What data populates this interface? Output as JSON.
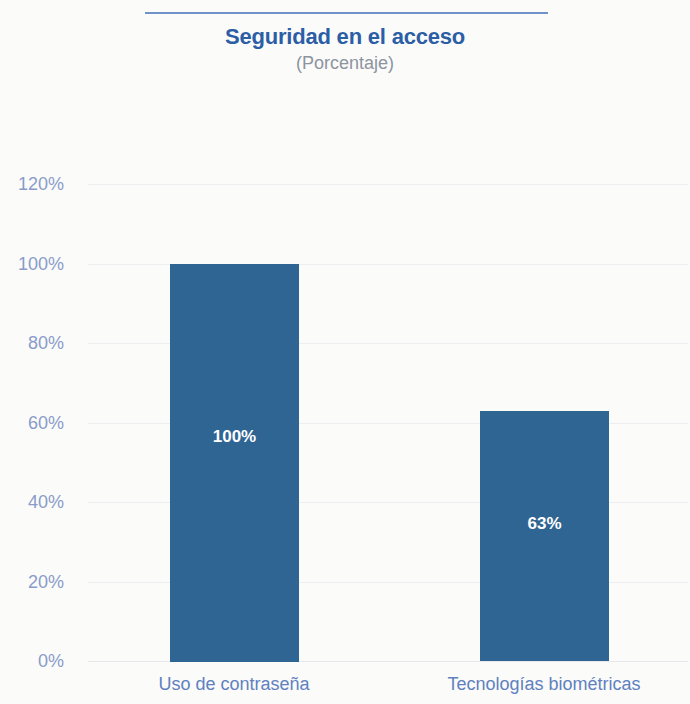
{
  "header": {
    "title": "Seguridad en el acceso",
    "subtitle": "(Porcentaje)",
    "rule_color": "#7192c9",
    "title_color": "#2c5ea6",
    "subtitle_color": "#8d94a0"
  },
  "chart_data": {
    "type": "bar",
    "title": "Seguridad en el acceso",
    "subtitle": "(Porcentaje)",
    "xlabel": "",
    "ylabel": "",
    "categories": [
      "Uso de contraseña",
      "Tecnologías biométricas"
    ],
    "values": [
      100,
      63
    ],
    "value_labels": [
      "100%",
      "63%"
    ],
    "ylim": [
      0,
      120
    ],
    "yticks": [
      0,
      20,
      40,
      60,
      80,
      100,
      120
    ],
    "ytick_labels": [
      "0%",
      "20%",
      "40%",
      "60%",
      "80%",
      "100%",
      "120%"
    ],
    "grid": true,
    "legend": false,
    "bar_color": "#2f6593",
    "tick_color": "#8a9bc9",
    "category_label_color": "#5f81bf",
    "background_color": "#fbfbfa"
  }
}
